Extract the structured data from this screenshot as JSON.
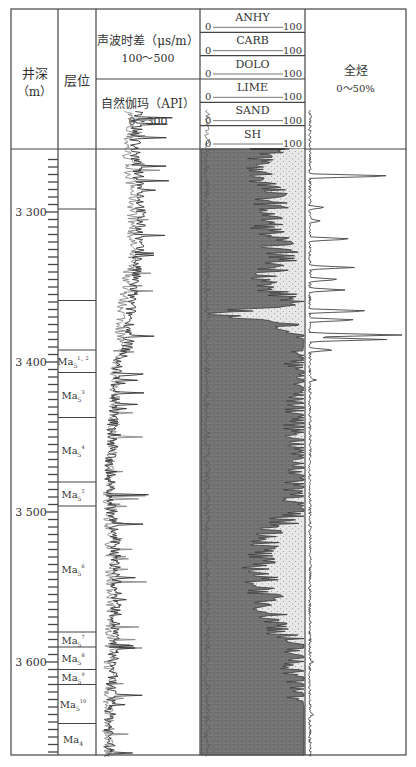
{
  "chart_data": {
    "type": "well-log",
    "title": "",
    "depth_axis": {
      "label": "井深",
      "unit_label": "（m）",
      "range": [
        3230,
        3665
      ],
      "major_ticks": [
        3300,
        3400,
        3500,
        3600
      ],
      "major_tick_labels": [
        "3 300",
        "3 400",
        "3 500",
        "3 600"
      ],
      "minor_tick_interval": 5
    },
    "formation_track": {
      "header": "层位",
      "zones": [
        {
          "top": 3230,
          "bottom": 3298,
          "label": ""
        },
        {
          "top": 3298,
          "bottom": 3359,
          "label": ""
        },
        {
          "top": 3359,
          "bottom": 3392,
          "label": ""
        },
        {
          "top": 3392,
          "bottom": 3407,
          "label": "Ma",
          "sub": "5",
          "sup": "1、2"
        },
        {
          "top": 3407,
          "bottom": 3437,
          "label": "Ma",
          "sub": "5",
          "sup": "3"
        },
        {
          "top": 3437,
          "bottom": 3480,
          "label": "Ma",
          "sub": "5",
          "sup": "4"
        },
        {
          "top": 3480,
          "bottom": 3496,
          "label": "Ma",
          "sub": "5",
          "sup": "5"
        },
        {
          "top": 3496,
          "bottom": 3580,
          "label": "Ma",
          "sub": "5",
          "sup": "6"
        },
        {
          "top": 3580,
          "bottom": 3590,
          "label": "Ma",
          "sub": "5",
          "sup": "7"
        },
        {
          "top": 3590,
          "bottom": 3605,
          "label": "Ma",
          "sub": "5",
          "sup": "8"
        },
        {
          "top": 3605,
          "bottom": 3615,
          "label": "Ma",
          "sub": "5",
          "sup": "9"
        },
        {
          "top": 3615,
          "bottom": 3641,
          "label": "Ma",
          "sub": "5",
          "sup": "10"
        },
        {
          "top": 3641,
          "bottom": 3665,
          "label": "Ma",
          "sub": "4",
          "sup": ""
        }
      ]
    },
    "curve_track": {
      "curves": [
        {
          "name": "声波时差（μs/m）",
          "range_label": "100～500",
          "min": 100,
          "max": 500
        },
        {
          "name": "自然伽玛（API）",
          "range_label": "0～300",
          "min": 0,
          "max": 300
        }
      ],
      "ac_profile": [
        [
          3230,
          230
        ],
        [
          3260,
          215
        ],
        [
          3290,
          240
        ],
        [
          3330,
          235
        ],
        [
          3360,
          200
        ],
        [
          3390,
          185
        ],
        [
          3400,
          170
        ],
        [
          3440,
          165
        ],
        [
          3470,
          150
        ],
        [
          3495,
          140
        ],
        [
          3520,
          150
        ],
        [
          3560,
          155
        ],
        [
          3600,
          145
        ],
        [
          3640,
          140
        ],
        [
          3665,
          140
        ]
      ],
      "gr_profile": [
        [
          3230,
          120
        ],
        [
          3260,
          110
        ],
        [
          3290,
          130
        ],
        [
          3330,
          120
        ],
        [
          3360,
          100
        ],
        [
          3390,
          90
        ],
        [
          3400,
          60
        ],
        [
          3440,
          45
        ],
        [
          3470,
          35
        ],
        [
          3495,
          40
        ],
        [
          3520,
          50
        ],
        [
          3560,
          55
        ],
        [
          3600,
          45
        ],
        [
          3640,
          35
        ],
        [
          3665,
          35
        ]
      ]
    },
    "lithology_track": {
      "scale_min": 0,
      "scale_max": 100,
      "scale_min_label": "0",
      "scale_max_label": "100",
      "components": [
        "ANHY",
        "CARB",
        "DOLO",
        "LIME",
        "SAND",
        "SH"
      ],
      "profile_dolo_lime_pct": [
        [
          3230,
          60
        ],
        [
          3250,
          75
        ],
        [
          3270,
          55
        ],
        [
          3290,
          70
        ],
        [
          3310,
          65
        ],
        [
          3330,
          80
        ],
        [
          3350,
          60
        ],
        [
          3360,
          95
        ],
        [
          3368,
          15
        ],
        [
          3375,
          85
        ],
        [
          3385,
          100
        ],
        [
          3400,
          98
        ],
        [
          3440,
          97
        ],
        [
          3470,
          99
        ],
        [
          3495,
          95
        ],
        [
          3510,
          75
        ],
        [
          3530,
          55
        ],
        [
          3550,
          60
        ],
        [
          3570,
          70
        ],
        [
          3590,
          90
        ],
        [
          3610,
          95
        ],
        [
          3630,
          100
        ],
        [
          3665,
          100
        ]
      ],
      "colors": {
        "dolo": "#6e6e6e",
        "lime": "#8a8a8a",
        "sand": "#e6e6e6",
        "shale_curve": "#3a3a3a"
      }
    },
    "gas_track": {
      "header": "全烃",
      "range_label": "0～50%",
      "min": 0,
      "max": 50,
      "peaks": [
        [
          3276,
          48
        ],
        [
          3297,
          10
        ],
        [
          3306,
          8
        ],
        [
          3318,
          25
        ],
        [
          3337,
          25
        ],
        [
          3345,
          18
        ],
        [
          3352,
          20
        ],
        [
          3366,
          35
        ],
        [
          3372,
          28
        ],
        [
          3382,
          50
        ],
        [
          3385,
          42
        ],
        [
          3392,
          15
        ],
        [
          3412,
          5
        ],
        [
          3600,
          4
        ],
        [
          3635,
          4
        ]
      ]
    }
  }
}
